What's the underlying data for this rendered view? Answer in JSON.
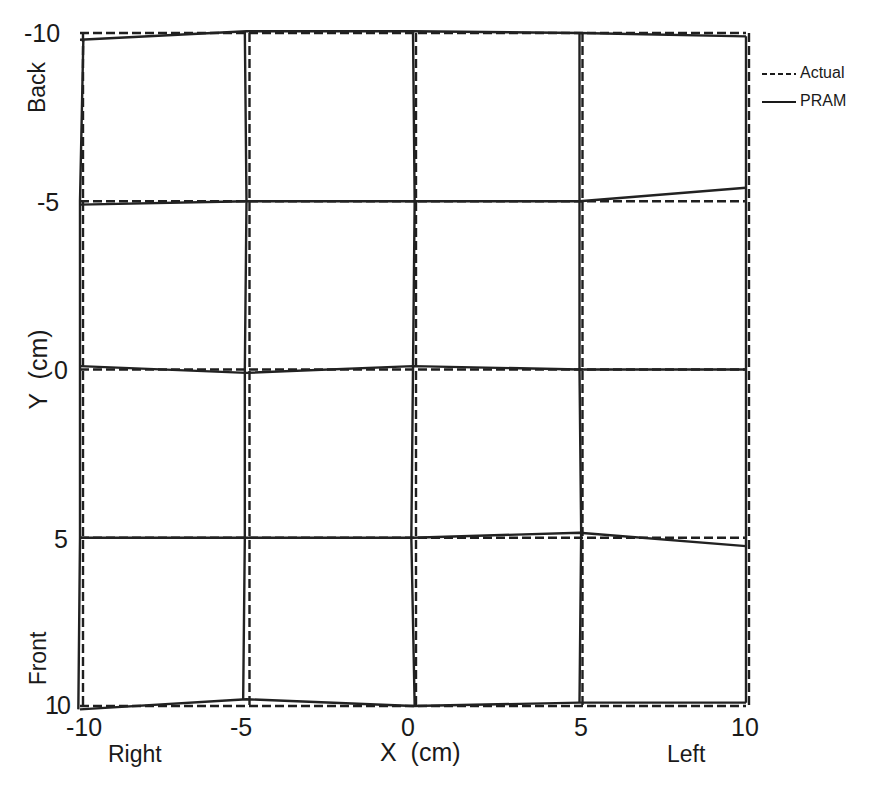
{
  "chart_data": {
    "type": "line",
    "title": "",
    "xlabel": "X  (cm)",
    "ylabel": "Y  (cm)",
    "x_side_labels": {
      "left": "Right",
      "right": "Left"
    },
    "y_side_labels": {
      "top": "Back",
      "bottom": "Front"
    },
    "xlim": [
      -10,
      10
    ],
    "ylim": [
      10,
      -10
    ],
    "y_axis_inverted": true,
    "x_ticks": [
      "-10",
      "-5",
      "0",
      "5",
      "10"
    ],
    "y_ticks": [
      "-10",
      "-5",
      "0",
      "5",
      "10"
    ],
    "grid": false,
    "legend_position": "upper right, outside plot",
    "legend": [
      {
        "label": "Actual",
        "style": "dashed"
      },
      {
        "label": "PRAM",
        "style": "solid"
      }
    ],
    "series": [
      {
        "name": "Actual",
        "style": "dashed",
        "description": "Ideal square grid of lines at x,y = -10,-5,0,5,10",
        "horizontal_lines_y": [
          -10,
          -5,
          0,
          5,
          10
        ],
        "vertical_lines_x": [
          -10,
          -5,
          0,
          5,
          10
        ]
      },
      {
        "name": "PRAM",
        "style": "solid",
        "description": "Measured grid; rows as polylines of (x,y) points",
        "rows": [
          {
            "nominal_y": -10,
            "points": [
              [
                -10,
                -9.8
              ],
              [
                -5,
                -10.05
              ],
              [
                0,
                -10.05
              ],
              [
                5,
                -10.0
              ],
              [
                10,
                -9.9
              ]
            ]
          },
          {
            "nominal_y": -5,
            "points": [
              [
                -10,
                -4.9
              ],
              [
                -5,
                -5.0
              ],
              [
                0,
                -5.0
              ],
              [
                5,
                -5.0
              ],
              [
                10,
                -5.4
              ]
            ]
          },
          {
            "nominal_y": 0,
            "points": [
              [
                -10,
                -0.1
              ],
              [
                -5,
                0.1
              ],
              [
                0,
                -0.1
              ],
              [
                5,
                0.0
              ],
              [
                10,
                0.0
              ]
            ]
          },
          {
            "nominal_y": 5,
            "points": [
              [
                -10,
                5.0
              ],
              [
                -5,
                5.0
              ],
              [
                0,
                5.0
              ],
              [
                5,
                4.85
              ],
              [
                10,
                5.25
              ]
            ]
          },
          {
            "nominal_y": 10,
            "points": [
              [
                -10,
                10.1
              ],
              [
                -5,
                9.8
              ],
              [
                0,
                10.0
              ],
              [
                5,
                9.9
              ],
              [
                10,
                9.9
              ]
            ]
          }
        ],
        "columns": [
          {
            "nominal_x": -10,
            "points": [
              [
                -9.9,
                -9.8
              ],
              [
                -10,
                -5
              ],
              [
                -10,
                0
              ],
              [
                -10,
                5
              ],
              [
                -10.05,
                10.1
              ]
            ]
          },
          {
            "nominal_x": -5,
            "points": [
              [
                -5.05,
                -10.05
              ],
              [
                -5.0,
                -5
              ],
              [
                -5.05,
                0
              ],
              [
                -5.05,
                5
              ],
              [
                -5.1,
                9.8
              ]
            ]
          },
          {
            "nominal_x": 0,
            "points": [
              [
                0,
                -10.05
              ],
              [
                0.05,
                -5
              ],
              [
                0,
                0
              ],
              [
                -0.05,
                5
              ],
              [
                0.05,
                10
              ]
            ]
          },
          {
            "nominal_x": 5,
            "points": [
              [
                5.0,
                -10
              ],
              [
                5.0,
                -5
              ],
              [
                5.0,
                0
              ],
              [
                5.05,
                4.85
              ],
              [
                5.0,
                9.9
              ]
            ]
          },
          {
            "nominal_x": 10,
            "points": [
              [
                10,
                -9.9
              ],
              [
                10,
                -5.4
              ],
              [
                10,
                0
              ],
              [
                10,
                5.25
              ],
              [
                10,
                9.9
              ]
            ]
          }
        ]
      }
    ]
  }
}
